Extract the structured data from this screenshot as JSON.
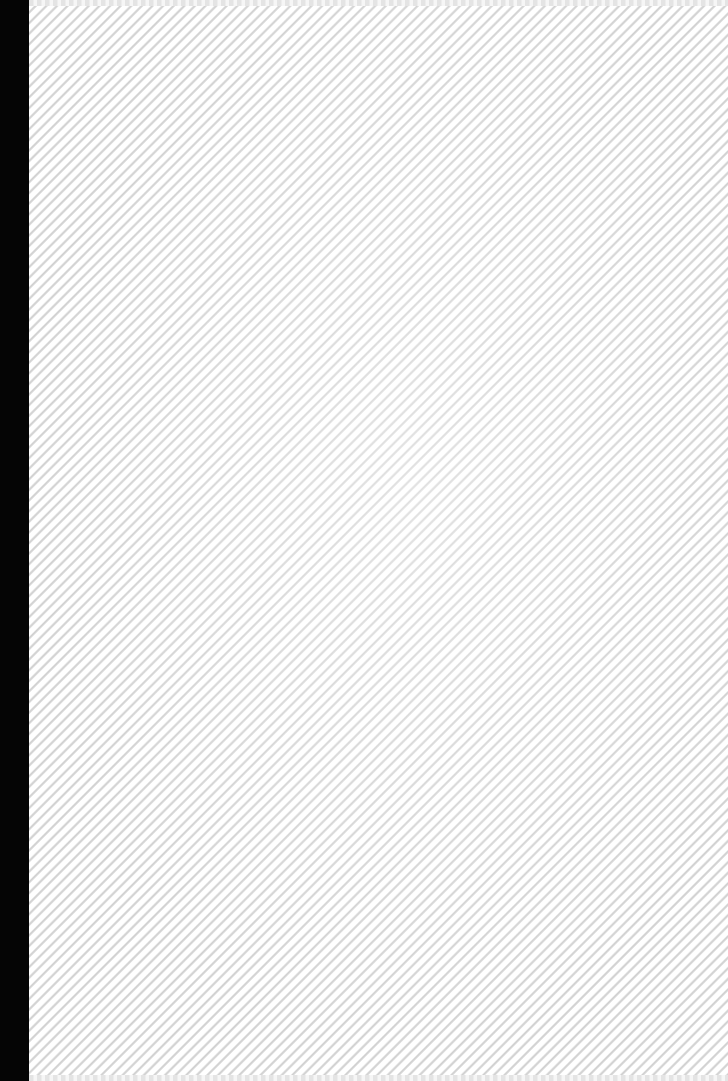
{
  "image": {
    "description": "Plain white cover with fine diagonal stripe texture and a black spine strip along the left edge",
    "colors": {
      "spine": "#050505",
      "cover": "#ffffff",
      "stripe": "#d4d4d4"
    },
    "text": []
  }
}
